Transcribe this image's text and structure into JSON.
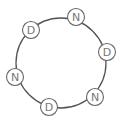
{
  "diagram": {
    "type": "ring",
    "ring": {
      "cx": 61,
      "cy": 63,
      "r": 45,
      "stroke": "#555555"
    },
    "nodes": [
      {
        "label": "D",
        "x": 31,
        "y": 30
      },
      {
        "label": "N",
        "x": 76,
        "y": 17
      },
      {
        "label": "D",
        "x": 107,
        "y": 52
      },
      {
        "label": "N",
        "x": 95,
        "y": 97
      },
      {
        "label": "D",
        "x": 49,
        "y": 107
      },
      {
        "label": "N",
        "x": 15,
        "y": 77
      }
    ]
  }
}
